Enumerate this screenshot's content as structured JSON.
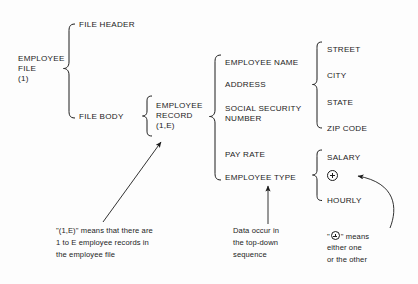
{
  "diagram": {
    "root": {
      "label_line1": "EMPLOYEE",
      "label_line2": "FILE",
      "label_line3": "(1)"
    },
    "level2": {
      "file_header": "FILE HEADER",
      "file_body": "FILE BODY"
    },
    "level3": {
      "label_line1": "EMPLOYEE",
      "label_line2": "RECORD",
      "label_line3": "(1,E)"
    },
    "record_fields": [
      "EMPLOYEE NAME",
      "ADDRESS",
      "SOCIAL SECURITY",
      "NUMBER",
      "PAY RATE",
      "EMPLOYEE TYPE"
    ],
    "address_fields": [
      "STREET",
      "CITY",
      "STATE",
      "ZIP CODE"
    ],
    "employee_type_options": [
      "SALARY",
      "HOURLY"
    ],
    "or_symbol": "plus-in-circle-icon"
  },
  "annotations": {
    "left": {
      "line1": "\"(1,E)\" means that there are",
      "line2": "1 to E employee records in",
      "line3": "the employee file"
    },
    "middle": {
      "line1": "Data occur in",
      "line2": "the top-down",
      "line3": "sequence"
    },
    "right": {
      "quote_open": "\"",
      "quote_close": "\"",
      "means": "means",
      "line2": "either one",
      "line3": "or the other"
    }
  },
  "colors": {
    "ink": "#1c1c1c",
    "background": "#fdfdfd"
  }
}
